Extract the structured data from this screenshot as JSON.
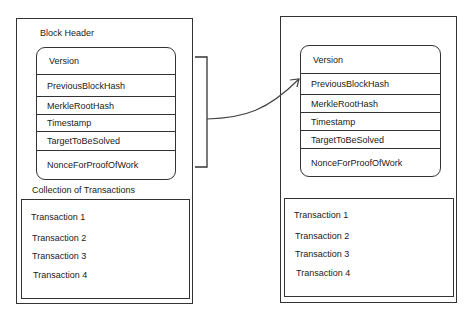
{
  "blocks": [
    {
      "header_label": "Block Header",
      "fields": [
        "Version",
        "PreviousBlockHash",
        "MerkleRootHash",
        "Timestamp",
        "TargetToBeSolved",
        "NonceForProofOfWork"
      ],
      "transactions_label": "Collection of Transactions",
      "transactions": [
        "Transaction 1",
        "Transaction 2",
        "Transaction 3",
        "Transaction 4"
      ]
    },
    {
      "fields": [
        "Version",
        "PreviousBlockHash",
        "MerkleRootHash",
        "Timestamp",
        "TargetToBeSolved",
        "NonceForProofOfWork"
      ],
      "transactions": [
        "Transaction 1",
        "Transaction 2",
        "Transaction 3",
        "Transaction 4"
      ]
    }
  ],
  "connector": {
    "description": "bracket around left block header, arrow to right block PreviousBlockHash"
  }
}
